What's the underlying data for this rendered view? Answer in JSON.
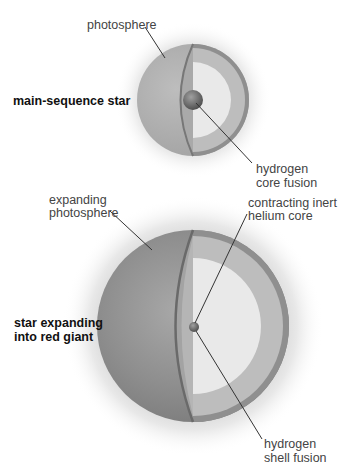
{
  "diagram": {
    "stage1": {
      "title": "main-sequence star",
      "labels": {
        "photosphere": "photosphere",
        "core_line1": "hydrogen",
        "core_line2": "core fusion"
      }
    },
    "stage2": {
      "title_line1": "star expanding",
      "title_line2": "into red giant",
      "labels": {
        "photosphere_line1": "expanding",
        "photosphere_line2": "photosphere",
        "core_line1": "contracting inert",
        "core_line2": "helium core",
        "shell_line1": "hydrogen",
        "shell_line2": "shell fusion"
      }
    },
    "colors": {
      "background": "#ffffff",
      "small_surface": "#b0b0b0",
      "large_surface": "#8c8c8c",
      "shell": "#bdbdbd",
      "rim": "#8f8f8f",
      "interior": "#e9e9e9",
      "core": "#6e6e6e",
      "leader_line": "#333333"
    }
  }
}
